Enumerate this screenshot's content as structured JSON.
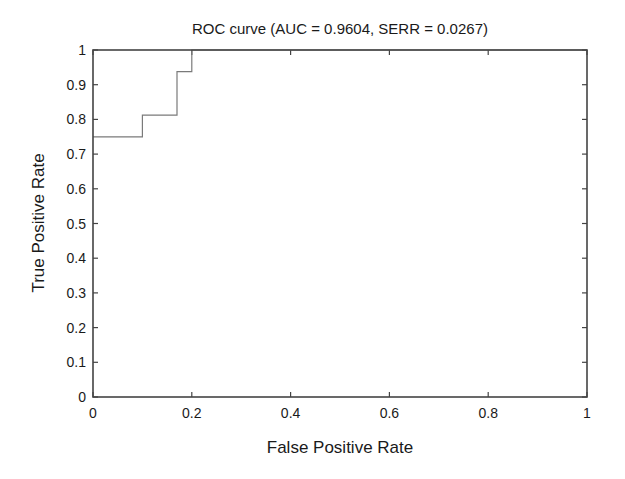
{
  "chart_data": {
    "type": "line",
    "title": "ROC curve (AUC = 0.9604, SERR = 0.0267)",
    "xlabel": "False Positive Rate",
    "ylabel": "True Positive Rate",
    "xlim": [
      0,
      1
    ],
    "ylim": [
      0,
      1
    ],
    "grid": false,
    "legend": null,
    "xticks": [
      0,
      0.2,
      0.4,
      0.6,
      0.8,
      1
    ],
    "xtick_labels": [
      "0",
      "0.2",
      "0.4",
      "0.6",
      "0.8",
      "1"
    ],
    "yticks": [
      0,
      0.1,
      0.2,
      0.3,
      0.4,
      0.5,
      0.6,
      0.7,
      0.8,
      0.9,
      1
    ],
    "ytick_labels": [
      "0",
      "0.1",
      "0.2",
      "0.3",
      "0.4",
      "0.5",
      "0.6",
      "0.7",
      "0.8",
      "0.9",
      "1"
    ],
    "series": [
      {
        "name": "ROC",
        "step": true,
        "x": [
          0,
          0.1,
          0.1,
          0.17,
          0.17,
          0.2,
          0.2,
          1
        ],
        "y": [
          0.75,
          0.75,
          0.8125,
          0.8125,
          0.9375,
          0.9375,
          1,
          1
        ]
      }
    ],
    "annotations": {
      "auc": 0.9604,
      "serr": 0.0267
    }
  },
  "colors": {
    "axes": "#444444",
    "curve": "#7a7a7a",
    "text": "#1a1a1a",
    "background": "#ffffff"
  }
}
